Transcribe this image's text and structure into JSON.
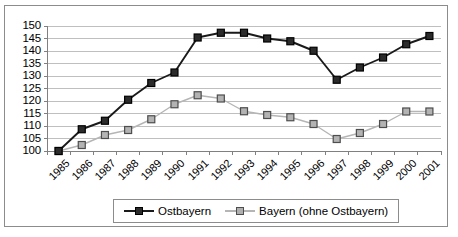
{
  "chart_data": {
    "type": "line",
    "title": "",
    "subtitle": "",
    "xlabel": "",
    "ylabel": "",
    "categories": [
      "1985",
      "1986",
      "1987",
      "1988",
      "1989",
      "1990",
      "1991",
      "1992",
      "1993",
      "1994",
      "1995",
      "1996",
      "1997",
      "1998",
      "1999",
      "2000",
      "2001"
    ],
    "ylim": [
      100,
      150
    ],
    "ytick_step": 5,
    "yticks": [
      "150",
      "145",
      "140",
      "135",
      "130",
      "125",
      "120",
      "115",
      "110",
      "105",
      "100"
    ],
    "grid": true,
    "legend_position": "bottom",
    "series": [
      {
        "name": "Ostbayern",
        "color": "#1a1a1a",
        "marker": "filled-square",
        "values": [
          100,
          108.7,
          112.1,
          120.5,
          127.2,
          131.4,
          145.4,
          147.3,
          147.3,
          145.0,
          143.9,
          140.1,
          128.5,
          133.4,
          137.4,
          142.7,
          146.0
        ]
      },
      {
        "name": "Bayern (ohne Ostbayern)",
        "color": "#b5b5b5",
        "marker": "open-square",
        "values": [
          100,
          102.4,
          106.4,
          108.4,
          112.7,
          118.7,
          122.3,
          121.0,
          115.9,
          114.4,
          113.5,
          110.8,
          104.8,
          107.2,
          110.8,
          115.8,
          115.8
        ]
      }
    ]
  },
  "legend": {
    "entries": [
      {
        "label": "Ostbayern"
      },
      {
        "label": "Bayern (ohne Ostbayern)"
      }
    ]
  },
  "colors": {
    "series_dark": "#1a1a1a",
    "series_gray": "#b5b5b5",
    "gridline": "#bfbfbf",
    "axis": "#808080",
    "frame": "#8c8c8c",
    "background": "#ffffff"
  }
}
